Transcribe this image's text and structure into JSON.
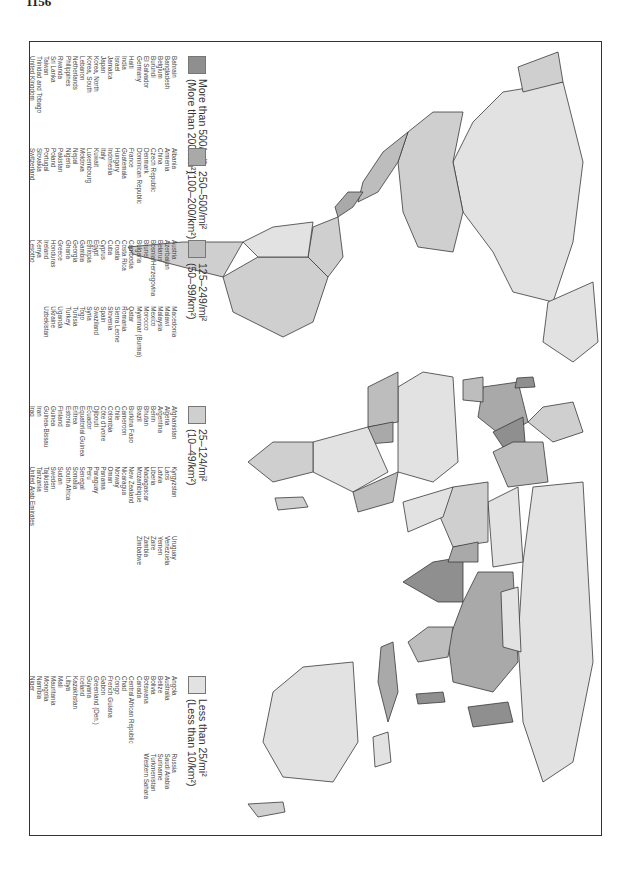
{
  "page": {
    "number": "1156"
  },
  "map": {
    "orientation": "rotated 90° (north to the left)",
    "colors": {
      "tier1": "#8f8f8f",
      "tier2": "#a9a9a9",
      "tier3": "#bdbdbd",
      "tier4": "#cfcfcf",
      "tier5": "#e2e2e2",
      "border": "#3a3a3a",
      "water": "#ffffff"
    }
  },
  "legend": {
    "groups": [
      {
        "title": "More than 500/mi²",
        "subtitle": "(More than 200/km²)",
        "color": "#8f8f8f",
        "columns": [
          [
            "Bahrain",
            "Bangladesh",
            "Belgium",
            "Burundi",
            "El Salvador",
            "Germany",
            "Haiti",
            "India",
            "Israel",
            "Jamaica",
            "Japan",
            "Korea, North",
            "Korea, South",
            "Lebanon",
            "Netherlands",
            "Philippines",
            "Rwanda",
            "Sri Lanka",
            "Taiwan",
            "Trinidad and Tobago",
            "United Kingdom",
            "Vietnam"
          ]
        ]
      },
      {
        "title": "250–500/mi²",
        "subtitle": "(100–200/km²)",
        "color": "#a9a9a9",
        "columns": [
          [
            "Albania",
            "Armenia",
            "China",
            "Czech Republic",
            "Denmark",
            "Dominican Republic",
            "France",
            "Guatemala",
            "Hungary",
            "Indonesia",
            "Italy",
            "Kuwait",
            "Luxembourg",
            "Moldova",
            "Nepal",
            "Nigeria",
            "Pakistan",
            "Poland",
            "Portugal",
            "Slovakia",
            "Switzerland",
            "Thailand",
            "Yugoslavia"
          ]
        ]
      },
      {
        "title": "125–249/mi²",
        "subtitle": "(50–99/km²)",
        "color": "#bdbdbd",
        "columns": [
          [
            "Austria",
            "Azerbaijan",
            "Belarus",
            "Bosnia/Herzegovina",
            "Brunei",
            "Bulgaria",
            "Cambodia",
            "Costa Rica",
            "Croatia",
            "Cuba",
            "Cyprus",
            "Egypt",
            "Ethiopia",
            "Gambia",
            "Georgia",
            "Ghana",
            "Greece",
            "Honduras",
            "Ireland",
            "Kenya",
            "Lesotho",
            "Lithuania"
          ],
          [
            "Macedonia",
            "Malawi",
            "Malaysia",
            "Mexico",
            "Morocco",
            "Myanmar (Burma)",
            "Qatar",
            "Romania",
            "Sierra Leone",
            "Slovenia",
            "Spain",
            "Swaziland",
            "Syria",
            "Togo",
            "Tunisia",
            "Turkey",
            "Uganda",
            "Ukraine",
            "Uzbekistan"
          ]
        ]
      },
      {
        "title": "25–124/mi²",
        "subtitle": "(10–49/km²)",
        "color": "#cfcfcf",
        "columns": [
          [
            "Afghanistan",
            "Algeria",
            "Argentina",
            "Benin",
            "Bhutan",
            "Brazil",
            "Burkina Faso",
            "Cameroon",
            "Chile",
            "Colombia",
            "Côte d'Ivoire",
            "Djibouti",
            "Ecuador",
            "Equatorial Guinea",
            "Eritrea",
            "Estonia",
            "Finland",
            "Guinea",
            "Guinea-Bissau",
            "Iran",
            "Iraq",
            "Jordan"
          ],
          [
            "Kyrgyzstan",
            "Laos",
            "Latvia",
            "Liberia",
            "Madagascar",
            "Mozambique",
            "New Zealand",
            "Nicaragua",
            "Norway",
            "Oman",
            "Panama",
            "Paraguay",
            "Peru",
            "Senegal",
            "Somalia",
            "South Africa",
            "Sudan",
            "Sweden",
            "Tajikistan",
            "Tanzania",
            "United Arab Emirates",
            "United States"
          ],
          [
            "Uruguay",
            "Venezuela",
            "Yemen",
            "Zaire",
            "Zambia",
            "Zimbabwe"
          ]
        ]
      },
      {
        "title": "Less than 25/mi²",
        "subtitle": "(Less than 10/km²)",
        "color": "#e2e2e2",
        "columns": [
          [
            "Angola",
            "Australia",
            "Belize",
            "Bolivia",
            "Botswana",
            "Canada",
            "Central African Republic",
            "Chad",
            "Congo",
            "French Guiana",
            "Gabon",
            "Greenland (Den.)",
            "Guyana",
            "Iceland",
            "Kazakhstan",
            "Libya",
            "Mali",
            "Mauritania",
            "Mongolia",
            "Namibia",
            "Niger",
            "Papua New Guinea"
          ],
          [
            "Russia",
            "Saudi Arabia",
            "Suriname",
            "Turkmenistan",
            "Western Sahara"
          ]
        ]
      }
    ]
  }
}
